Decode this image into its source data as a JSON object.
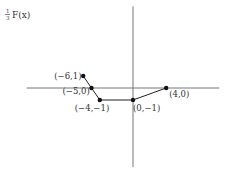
{
  "chart_data": {
    "type": "line",
    "title": "",
    "xlabel": "",
    "ylabel": "F(x)",
    "ylabel_coefficient": {
      "numerator": "1",
      "denominator": "3"
    },
    "xlim": [
      -12.8,
      10.4
    ],
    "ylim": [
      -6.6,
      6.8
    ],
    "grid": false,
    "legend": "none",
    "series": [
      {
        "name": "1/3 F(x)",
        "color": "#222222",
        "points": [
          {
            "x": -6,
            "y": 1,
            "label": "(−6,1)"
          },
          {
            "x": -5,
            "y": 0,
            "label": "(−5,0)"
          },
          {
            "x": -4,
            "y": -1,
            "label": "(−4,−1)"
          },
          {
            "x": 0,
            "y": -1,
            "label": "(0,−1)"
          },
          {
            "x": 4,
            "y": 0,
            "label": "(4,0)"
          }
        ]
      }
    ]
  }
}
